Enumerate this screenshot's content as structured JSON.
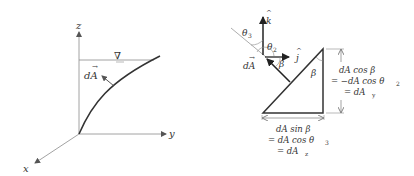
{
  "left_diagram": {
    "axes": {
      "z": "z",
      "y": "y",
      "x": "x"
    },
    "free_surface_symbol": "∇",
    "area_vector_label": "dA",
    "vector_arrow": "→"
  },
  "right_diagram": {
    "unit_vectors": {
      "k": "k",
      "j": "j",
      "hat": "^"
    },
    "angles": {
      "theta3": "θ",
      "theta3_sub": "3",
      "theta2": "θ",
      "theta2_sub": "2",
      "beta_vector": "β",
      "beta_triangle": "β"
    },
    "area_vector_label": "dA",
    "vector_arrow": "→",
    "vertical_side": {
      "line1": "dA cos β",
      "line2": "= −dA cos θ",
      "line2_sub": "2",
      "line3": "= dA",
      "line3_sub": "y"
    },
    "horizontal_side": {
      "line1": "dA sin β",
      "line2": "= dA cos θ",
      "line2_sub": "3",
      "line3": "= dA",
      "line3_sub": "z"
    }
  },
  "colors": {
    "ink": "#333333",
    "thin": "#8a8a8a",
    "background": "#ffffff"
  }
}
